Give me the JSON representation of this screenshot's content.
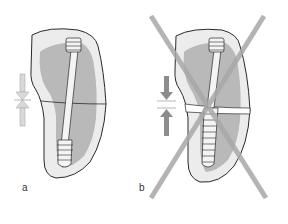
{
  "panels": [
    {
      "id": "a",
      "label": "a",
      "description": "Partially threaded lag screw compresses fracture",
      "arrow_color": "#d9d9d9",
      "crossed_out": false
    },
    {
      "id": "b",
      "label": "b",
      "description": "Fully threaded screw keeps fracture gap open",
      "arrow_color": "#8c8c8c",
      "crossed_out": true
    }
  ],
  "colors": {
    "bone_outer": "#ececec",
    "bone_inner": "#b9b9b9",
    "outline": "#2a2a2a",
    "screw_fill": "#f4f4f4",
    "cross": "#a8a8a8"
  }
}
